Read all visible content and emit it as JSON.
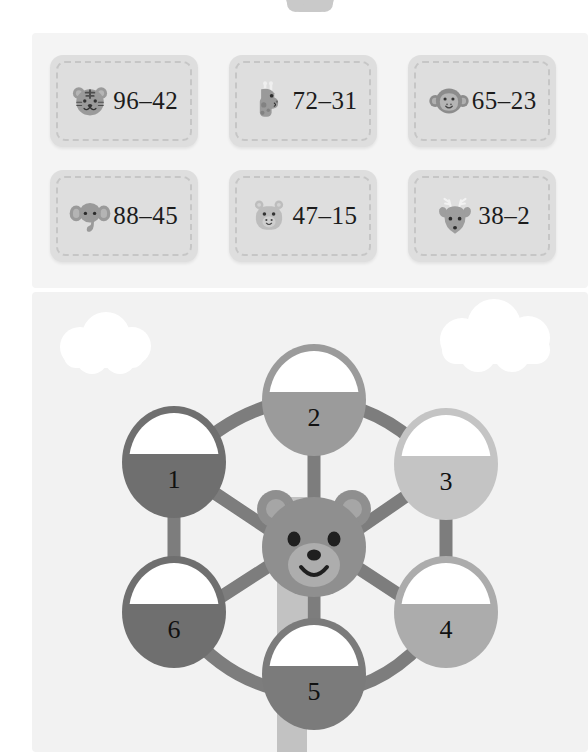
{
  "worksheet": {
    "title_visible": false,
    "background_color": "#ffffff",
    "panel_color": "#f3f3f3"
  },
  "top_shape": {
    "name": "cloud-nub-partial",
    "color": "#c9c9c9"
  },
  "cards": {
    "panel_color": "#f4f4f4",
    "card_color": "#dedede",
    "dash_color": "#c6c6c6",
    "items": [
      {
        "icon": "tiger-face-icon",
        "animal": "tiger",
        "expression": "96–42",
        "minuend": 96,
        "subtrahend": 42
      },
      {
        "icon": "giraffe-face-icon",
        "animal": "giraffe",
        "expression": "72–31",
        "minuend": 72,
        "subtrahend": 31
      },
      {
        "icon": "monkey-face-icon",
        "animal": "monkey",
        "expression": "65–23",
        "minuend": 65,
        "subtrahend": 23
      },
      {
        "icon": "elephant-face-icon",
        "animal": "elephant",
        "expression": "88–45",
        "minuend": 88,
        "subtrahend": 45
      },
      {
        "icon": "hippo-face-icon",
        "animal": "hippo",
        "expression": "47–15",
        "minuend": 47,
        "subtrahend": 15
      },
      {
        "icon": "deer-face-icon",
        "animal": "deer",
        "expression": "38–2",
        "minuend": 38,
        "subtrahend": 2
      }
    ]
  },
  "puzzle": {
    "panel_color": "#f2f2f2",
    "center_icon": "bear-face-icon",
    "center_color": "#8f8f8f",
    "center_muzzle_color": "#a8a8a8",
    "spoke_color": "#7d7d7d",
    "pole_color": "#c2c2c2",
    "cloud_color": "#ffffff",
    "nodes": [
      {
        "label": "1",
        "color": "#6f6f6f",
        "answer_box": "empty"
      },
      {
        "label": "2",
        "color": "#9b9b9b",
        "answer_box": "empty"
      },
      {
        "label": "3",
        "color": "#c4c4c4",
        "answer_box": "empty"
      },
      {
        "label": "4",
        "color": "#acacac",
        "answer_box": "empty"
      },
      {
        "label": "5",
        "color": "#7b7b7b",
        "answer_box": "empty"
      },
      {
        "label": "6",
        "color": "#6f6f6f",
        "answer_box": "empty"
      }
    ],
    "clouds": [
      {
        "name": "cloud-left"
      },
      {
        "name": "cloud-right"
      }
    ]
  }
}
